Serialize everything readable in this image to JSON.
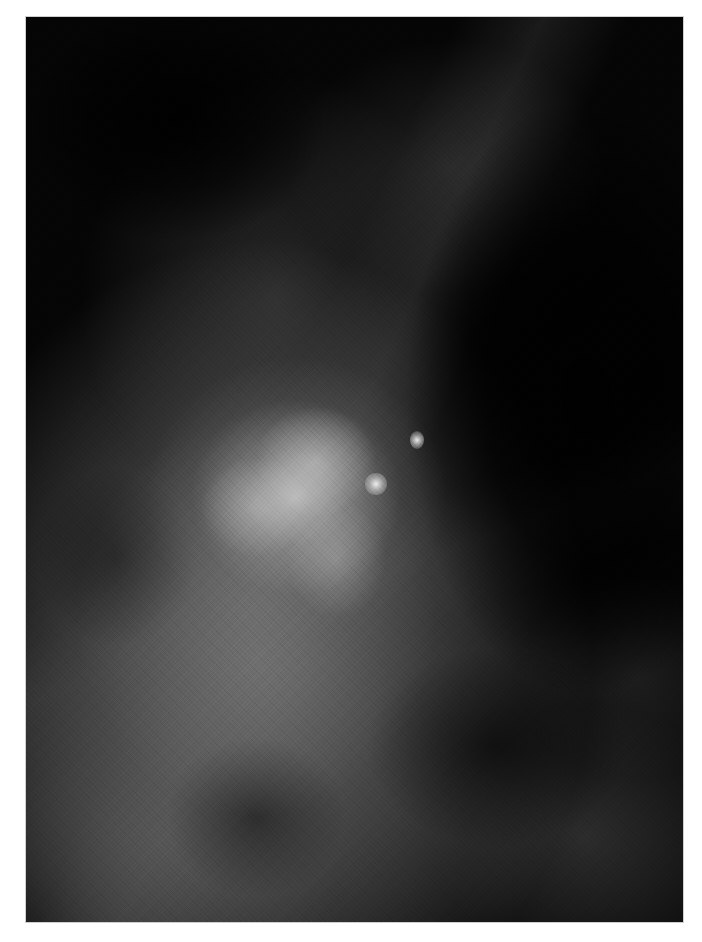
{
  "image": {
    "type": "grayscale radiograph (mammogram crop)",
    "background_color": "#ffffff",
    "frame": {
      "left": 26,
      "top": 17,
      "width": 657,
      "height": 905
    },
    "features": [
      {
        "name": "dense-mass",
        "description": "bright irregular dense region",
        "center": [
          270,
          480
        ]
      },
      {
        "name": "bright-speck",
        "description": "small bright focus",
        "center": [
          391,
          423
        ]
      },
      {
        "name": "bright-speck",
        "description": "small bright focus",
        "center": [
          350,
          467
        ]
      },
      {
        "name": "dark-region",
        "description": "dark rounded area upper-left",
        "center": [
          150,
          105
        ]
      },
      {
        "name": "dark-region",
        "description": "dark area right side",
        "center": [
          560,
          380
        ]
      }
    ],
    "colors": {
      "darkest": "#050505",
      "mid_tissue": "#5f5f5f",
      "brightest": "#e6e6e6"
    }
  }
}
